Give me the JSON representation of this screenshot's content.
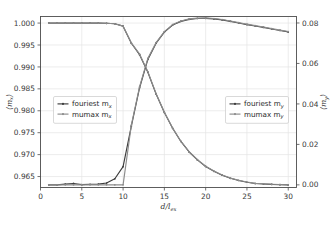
{
  "figure": {
    "background": "#ffffff",
    "plot_background": "#ffffff",
    "grid_color": "#e4e4e4",
    "spine_color": "#4d4d4d"
  },
  "axis_labels": {
    "x": "d/l",
    "x_sub": "ex",
    "y_left_open": "⟨m",
    "y_left_sub": "x",
    "y_left_close": "⟩",
    "y_right_open": "⟨m",
    "y_right_sub": "y",
    "y_right_close": "⟩"
  },
  "ticks": {
    "x": [
      "0",
      "5",
      "10",
      "15",
      "20",
      "25",
      "30"
    ],
    "x_values": [
      0,
      5,
      10,
      15,
      20,
      25,
      30
    ],
    "y_left": [
      "0.965",
      "0.970",
      "0.975",
      "0.980",
      "0.985",
      "0.990",
      "0.995",
      "1.000"
    ],
    "y_left_values": [
      0.965,
      0.97,
      0.975,
      0.98,
      0.985,
      0.99,
      0.995,
      1.0
    ],
    "y_right": [
      "0.00",
      "0.02",
      "0.04",
      "0.06",
      "0.08"
    ],
    "y_right_values": [
      0.0,
      0.02,
      0.04,
      0.06,
      0.08
    ]
  },
  "legend_left": {
    "entries": [
      {
        "label": "fouriest m",
        "sub": "x",
        "color": "#3c3c3c",
        "marker": "dot"
      },
      {
        "label": "mumax m",
        "sub": "x",
        "color": "#8c8c8c",
        "marker": "dot"
      }
    ]
  },
  "legend_right": {
    "entries": [
      {
        "label": "fouriest m",
        "sub": "y",
        "color": "#3c3c3c",
        "marker": "dot"
      },
      {
        "label": "mumax m",
        "sub": "y",
        "color": "#8c8c8c",
        "marker": "dot"
      }
    ]
  },
  "chart_data": {
    "type": "line",
    "title": "",
    "xlabel": "d/l_ex",
    "ylabel": "<m_x>",
    "ylabel_right": "<m_y>",
    "xlim": [
      0,
      31
    ],
    "ylim_left": [
      0.9625,
      1.0015
    ],
    "ylim_right": [
      -0.0013,
      0.0832
    ],
    "grid": true,
    "legend_position": [
      "center-left",
      "center-right"
    ],
    "x": [
      1,
      2,
      3,
      4,
      5,
      6,
      7,
      8,
      9,
      10,
      11,
      12,
      13,
      14,
      15,
      16,
      17,
      18,
      19,
      20,
      21,
      22,
      23,
      24,
      25,
      26,
      27,
      28,
      29,
      30
    ],
    "series": [
      {
        "name": "fouriest m_x",
        "axis": "left",
        "color": "#3c3c3c",
        "values": [
          1.0,
          1.0,
          1.0,
          1.0,
          1.0,
          1.0,
          1.0,
          0.99995,
          0.99985,
          0.9993,
          0.9954,
          0.9928,
          0.9888,
          0.9838,
          0.9796,
          0.976,
          0.973,
          0.9706,
          0.9688,
          0.9673,
          0.9662,
          0.9653,
          0.9646,
          0.9641,
          0.9637,
          0.9634,
          0.9633,
          0.9632,
          0.96315,
          0.9631
        ]
      },
      {
        "name": "mumax m_x",
        "axis": "left",
        "color": "#8c8c8c",
        "values": [
          1.0,
          1.0,
          1.0,
          1.0,
          1.0,
          1.0,
          1.0,
          0.99995,
          0.99985,
          0.9993,
          0.9955,
          0.9929,
          0.9889,
          0.9839,
          0.97965,
          0.97605,
          0.97305,
          0.97065,
          0.96885,
          0.96735,
          0.96625,
          0.96535,
          0.96465,
          0.96415,
          0.96375,
          0.96345,
          0.96335,
          0.96325,
          0.96318,
          0.96312
        ]
      },
      {
        "name": "fouriest m_y",
        "axis": "right",
        "color": "#3c3c3c",
        "values": [
          0.0,
          0.0,
          0.0004,
          0.0007,
          0.0001,
          0.0003,
          0.0004,
          0.0009,
          0.003,
          0.009,
          0.029,
          0.048,
          0.062,
          0.07,
          0.0755,
          0.079,
          0.0808,
          0.0818,
          0.0822,
          0.0823,
          0.082,
          0.0815,
          0.0808,
          0.08,
          0.0792,
          0.0785,
          0.0778,
          0.077,
          0.0763,
          0.0756
        ]
      },
      {
        "name": "mumax m_y",
        "axis": "right",
        "color": "#8c8c8c",
        "values": [
          0.0,
          0.0,
          0.0,
          0.0,
          0.0,
          0.0,
          0.0,
          0.0,
          0.0,
          0.0,
          0.0295,
          0.0485,
          0.0625,
          0.0703,
          0.0757,
          0.0792,
          0.081,
          0.082,
          0.0824,
          0.0825,
          0.0822,
          0.0817,
          0.081,
          0.0802,
          0.0794,
          0.0787,
          0.078,
          0.0772,
          0.0765,
          0.0758
        ]
      }
    ]
  }
}
